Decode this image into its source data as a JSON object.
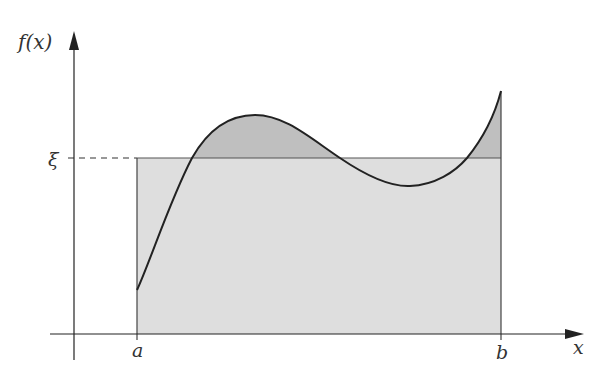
{
  "diagram": {
    "y_axis_label": "f(x)",
    "x_axis_label": "x",
    "xi_label": "ξ",
    "a_label": "a",
    "b_label": "b",
    "colors": {
      "axis": "#222222",
      "curve": "#222222",
      "rectangle_fill": "#dedede",
      "above_xi_fill": "#bfbfbf",
      "rectangle_stroke": "#555555",
      "dashed_line": "#333333"
    },
    "geometry": {
      "y_axis_x": 74,
      "y_axis_top": 32,
      "y_axis_bottom": 360,
      "x_axis_y": 334,
      "x_axis_left": 50,
      "x_axis_right": 583,
      "a_x": 137,
      "b_x": 501,
      "xi_y": 158,
      "curve_points": [
        [
          137,
          290
        ],
        [
          160,
          235
        ],
        [
          192,
          158
        ],
        [
          220,
          126
        ],
        [
          255,
          115
        ],
        [
          290,
          124
        ],
        [
          340,
          158
        ],
        [
          380,
          180
        ],
        [
          410,
          186
        ],
        [
          440,
          178
        ],
        [
          467,
          158
        ],
        [
          490,
          120
        ],
        [
          501,
          91
        ]
      ]
    }
  }
}
